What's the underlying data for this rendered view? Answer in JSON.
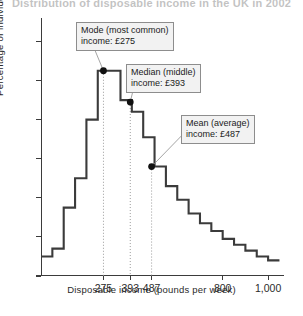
{
  "chart_data": {
    "type": "bar",
    "title": "Distribution of disposable income in the UK in 2002",
    "xlabel": "Disposable income (pounds per week)",
    "ylabel": "Percentage of individuals",
    "xlim": [
      0,
      1070
    ],
    "ylim": [
      0,
      13.2
    ],
    "grid": false,
    "legend": null,
    "ytick_values": [
      0,
      2,
      4,
      6,
      8,
      10,
      12
    ],
    "ytick_labels": [
      "0",
      "2",
      "4",
      "6",
      "8",
      "10",
      "12"
    ],
    "xtick_values": [
      275,
      393,
      487,
      800,
      1000
    ],
    "xtick_labels": [
      "275",
      "393",
      "487",
      "800",
      "1,000"
    ],
    "bin_width": 50,
    "bin_starts": [
      0,
      50,
      100,
      150,
      200,
      250,
      300,
      350,
      400,
      450,
      500,
      550,
      600,
      650,
      700,
      750,
      800,
      850,
      900,
      950,
      1000
    ],
    "values": [
      1.0,
      1.4,
      3.5,
      5.0,
      8.0,
      10.5,
      10.5,
      9.0,
      8.4,
      7.1,
      5.6,
      4.6,
      3.9,
      3.2,
      2.7,
      2.3,
      1.9,
      1.6,
      1.3,
      1.0,
      0.8
    ],
    "annotations": [
      {
        "name": "mode",
        "label_line1": "Mode (most common)",
        "label_line2": "income: £275",
        "x": 275,
        "y": 10.5,
        "value": 275
      },
      {
        "name": "median",
        "label_line1": "Median (middle)",
        "label_line2": "income: £393",
        "x": 393,
        "y": 8.9,
        "value": 393
      },
      {
        "name": "mean",
        "label_line1": "Mean (average)",
        "label_line2": "income: £487",
        "x": 487,
        "y": 5.6,
        "value": 487
      }
    ],
    "colors": {
      "line": "#3b3b3b",
      "axis": "#3b3b3b",
      "marker": "#111111",
      "dropline": "#9a9a9a",
      "callout_bg": "#f2f2f2",
      "callout_border": "#8d8d8d",
      "background": "#ffffff"
    }
  }
}
